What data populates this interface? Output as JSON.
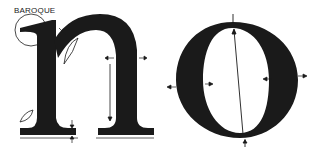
{
  "diagram": {
    "title_label": "BAROQUE",
    "letters": [
      "n",
      "o"
    ],
    "colors": {
      "ink": "#1a1a1a",
      "background": "#ffffff"
    },
    "annotations": {
      "serif_circle": "serif detail circle on n",
      "bracket_highlights": 2,
      "stroke_width_arrows": "paired arrows showing stem and bowl thickness",
      "stress_axis": "tilted axis line through o"
    }
  }
}
